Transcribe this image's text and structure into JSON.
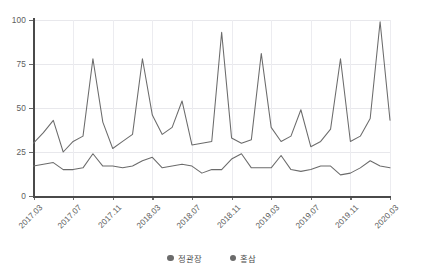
{
  "chart_data": {
    "type": "line",
    "title": "",
    "xlabel": "",
    "ylabel": "",
    "ylim": [
      0,
      100
    ],
    "yticks": [
      0,
      25,
      50,
      75,
      100
    ],
    "grid": true,
    "legend_position": "bottom",
    "x": [
      "2017.03",
      "2017.04",
      "2017.05",
      "2017.06",
      "2017.07",
      "2017.08",
      "2017.09",
      "2017.10",
      "2017.11",
      "2017.12",
      "2018.01",
      "2018.02",
      "2018.03",
      "2018.04",
      "2018.05",
      "2018.06",
      "2018.07",
      "2018.08",
      "2018.09",
      "2018.10",
      "2018.11",
      "2018.12",
      "2019.01",
      "2019.02",
      "2019.03",
      "2019.04",
      "2019.05",
      "2019.06",
      "2019.07",
      "2019.08",
      "2019.09",
      "2019.10",
      "2019.11",
      "2019.12",
      "2020.01",
      "2020.02",
      "2020.03"
    ],
    "xtick_labels": [
      "2017.03",
      "2017.07",
      "2017.11",
      "2018.03",
      "2018.07",
      "2018.11",
      "2019.03",
      "2019.07",
      "2019.11",
      "2020.03"
    ],
    "xtick_indices": [
      0,
      4,
      8,
      12,
      16,
      20,
      24,
      28,
      32,
      36
    ],
    "series": [
      {
        "name": "정관장",
        "color": "#6b6b6b",
        "values": [
          30,
          36,
          43,
          25,
          31,
          34,
          78,
          42,
          27,
          31,
          35,
          78,
          46,
          35,
          39,
          54,
          29,
          30,
          31,
          93,
          33,
          30,
          32,
          81,
          39,
          31,
          34,
          49,
          28,
          31,
          38,
          78,
          31,
          34,
          44,
          99,
          43
        ]
      },
      {
        "name": "홍삼",
        "color": "#6b6b6b",
        "values": [
          17,
          18,
          19,
          15,
          15,
          16,
          24,
          17,
          17,
          16,
          17,
          20,
          22,
          16,
          17,
          18,
          17,
          13,
          15,
          15,
          21,
          24,
          16,
          16,
          16,
          23,
          15,
          14,
          15,
          17,
          17,
          12,
          13,
          16,
          20,
          17,
          16
        ]
      }
    ]
  },
  "legend": {
    "items": [
      {
        "label": "정관장",
        "color": "#6b6b6b"
      },
      {
        "label": "홍삼",
        "color": "#6b6b6b"
      }
    ]
  },
  "axis": {
    "y_labels": [
      "100",
      "75",
      "50",
      "25",
      "0"
    ],
    "x_labels": [
      "2017.03",
      "2017.07",
      "2017.11",
      "2018.03",
      "2018.07",
      "2018.11",
      "2019.03",
      "2019.07",
      "2019.11",
      "2020.03"
    ]
  },
  "style": {
    "line_color": "#6b6b6b",
    "grid_color": "#e8e8ec",
    "axis_color": "#4a4a4a",
    "text_color": "#5d5d5d"
  }
}
